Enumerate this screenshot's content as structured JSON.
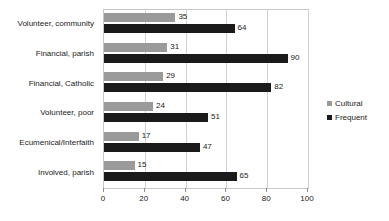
{
  "chart_data": {
    "type": "bar",
    "orientation": "horizontal",
    "title": "",
    "subtitle": "",
    "xlabel": "",
    "ylabel": "",
    "xlim": [
      0,
      100
    ],
    "xticks": [
      "0",
      "20",
      "40",
      "60",
      "80",
      "100"
    ],
    "grid": "vertical",
    "legend_position": "right",
    "categories": [
      "Volunteer, community",
      "Financial, parish",
      "Financial, Catholic",
      "Volunteer, poor",
      "Ecumenical/Interfaith",
      "Involved, parish"
    ],
    "series": [
      {
        "name": "Cultural",
        "color": "#9a9a9a",
        "values": [
          35,
          31,
          29,
          24,
          17,
          15
        ]
      },
      {
        "name": "Frequent",
        "color": "#1a1a1a",
        "values": [
          64,
          90,
          82,
          51,
          47,
          65
        ]
      }
    ],
    "data_labels": {
      "Cultural": [
        "35",
        "31",
        "29",
        "24",
        "17",
        "15"
      ],
      "Frequent": [
        "64",
        "90",
        "82",
        "51",
        "47",
        "65"
      ]
    }
  },
  "legend": {
    "items": [
      {
        "label": "Cultural",
        "color": "#9a9a9a",
        "marker": "square-swatch"
      },
      {
        "label": "Frequent",
        "color": "#1a1a1a",
        "marker": "square-swatch"
      }
    ]
  }
}
